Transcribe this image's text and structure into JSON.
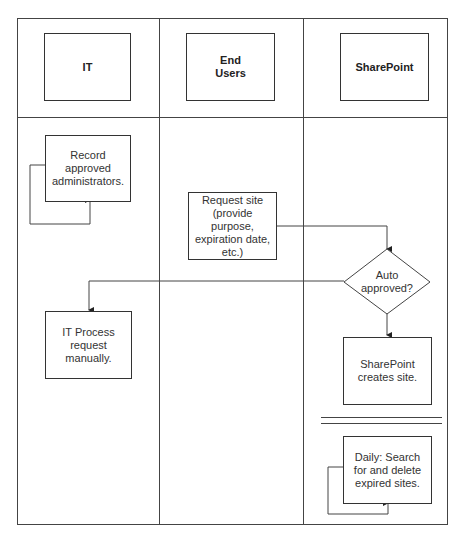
{
  "lanes": [
    {
      "id": "it",
      "label": "IT"
    },
    {
      "id": "end-users",
      "label": "End\nUsers"
    },
    {
      "id": "sharepoint",
      "label": "SharePoint"
    }
  ],
  "nodes": {
    "record_admins": {
      "lane": "IT",
      "text": "Record approved administrators.",
      "self_loop": true
    },
    "request_site": {
      "lane": "End Users",
      "text": "Request site (provide purpose, expiration date, etc.)"
    },
    "auto_approved": {
      "lane": "SharePoint",
      "type": "decision",
      "text": "Auto approved?"
    },
    "it_process": {
      "lane": "IT",
      "text": "IT Process request manually."
    },
    "sp_creates": {
      "lane": "SharePoint",
      "text": "SharePoint creates site."
    },
    "daily_search": {
      "lane": "SharePoint",
      "text": "Daily: Search for and delete expired sites.",
      "self_loop": true
    }
  },
  "edges": [
    {
      "from": "request_site",
      "to": "auto_approved"
    },
    {
      "from": "auto_approved",
      "to": "it_process",
      "label": ""
    },
    {
      "from": "auto_approved",
      "to": "sp_creates",
      "label": ""
    },
    {
      "from": "record_admins",
      "to": "record_admins"
    },
    {
      "from": "daily_search",
      "to": "daily_search"
    }
  ],
  "colors": {
    "line": "#333333",
    "background": "#ffffff"
  }
}
